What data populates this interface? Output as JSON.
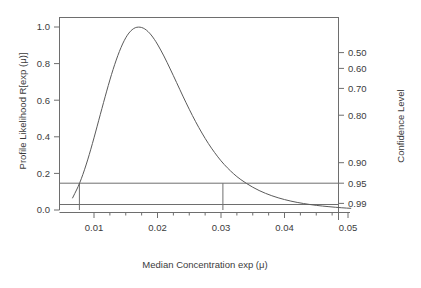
{
  "chart_data": {
    "type": "line",
    "title": "",
    "xlabel": "Median Concentration exp (μ)",
    "ylabel": "Profile Likelihood R[exp (μ)]",
    "y2label": "Confidence Level",
    "xlim": [
      0.0055,
      0.0505
    ],
    "ylim": [
      0.0,
      1.05
    ],
    "grid": false,
    "legend": null,
    "x_ticks": [
      0.01,
      0.02,
      0.03,
      0.04,
      0.05
    ],
    "x_tick_labels": [
      "0.01",
      "0.02",
      "0.03",
      "0.04",
      "0.05"
    ],
    "x_minor_ticks": [
      0.0125,
      0.015,
      0.0175,
      0.0225,
      0.025,
      0.0275,
      0.0325,
      0.035,
      0.0375,
      0.0425,
      0.045,
      0.0475
    ],
    "y_ticks": [
      0.0,
      0.2,
      0.4,
      0.6,
      0.8,
      1.0
    ],
    "y_tick_labels": [
      "0.0",
      "0.2",
      "0.4",
      "0.6",
      "0.8",
      "1.0"
    ],
    "y2_ticks": [
      0.5,
      0.6,
      0.7,
      0.8,
      0.9,
      0.95,
      0.99
    ],
    "y2_tick_labels": [
      "0.50",
      "0.60",
      "0.70",
      "0.80",
      "0.90",
      "0.95",
      "0.99"
    ],
    "y2_likelihood_values": [
      0.8601,
      0.7738,
      0.6644,
      0.518,
      0.2585,
      0.1465,
      0.0362
    ],
    "reference_line_y": 0.1465,
    "reference_line_label": "0.95",
    "confidence_interval": [
      0.0077,
      0.0303
    ],
    "peak": {
      "x": 0.0175,
      "y": 1.0
    },
    "series": [
      {
        "name": "Profile Likelihood",
        "x": [
          0.0066,
          0.007,
          0.0075,
          0.008,
          0.0085,
          0.009,
          0.0095,
          0.01,
          0.0105,
          0.011,
          0.0115,
          0.012,
          0.0125,
          0.013,
          0.0135,
          0.014,
          0.0145,
          0.015,
          0.0155,
          0.016,
          0.0165,
          0.017,
          0.0175,
          0.018,
          0.0185,
          0.019,
          0.0195,
          0.02,
          0.021,
          0.022,
          0.023,
          0.024,
          0.025,
          0.026,
          0.027,
          0.028,
          0.029,
          0.03,
          0.031,
          0.032,
          0.033,
          0.035,
          0.037,
          0.039,
          0.041,
          0.043,
          0.045,
          0.047,
          0.049,
          0.0505
        ],
        "y": [
          0.064,
          0.092,
          0.127,
          0.17,
          0.219,
          0.273,
          0.332,
          0.394,
          0.458,
          0.523,
          0.587,
          0.65,
          0.711,
          0.768,
          0.82,
          0.867,
          0.908,
          0.942,
          0.968,
          0.986,
          0.997,
          1.0,
          0.998,
          0.99,
          0.976,
          0.957,
          0.933,
          0.906,
          0.843,
          0.771,
          0.697,
          0.622,
          0.55,
          0.482,
          0.42,
          0.363,
          0.313,
          0.268,
          0.23,
          0.197,
          0.168,
          0.123,
          0.09,
          0.066,
          0.048,
          0.035,
          0.025,
          0.018,
          0.012,
          0.009
        ]
      }
    ]
  },
  "axes": {
    "left_title": "Profile Likelihood R[exp (μ)]",
    "bottom_title": "Median Concentration exp (μ)",
    "right_title": "Confidence Level"
  }
}
